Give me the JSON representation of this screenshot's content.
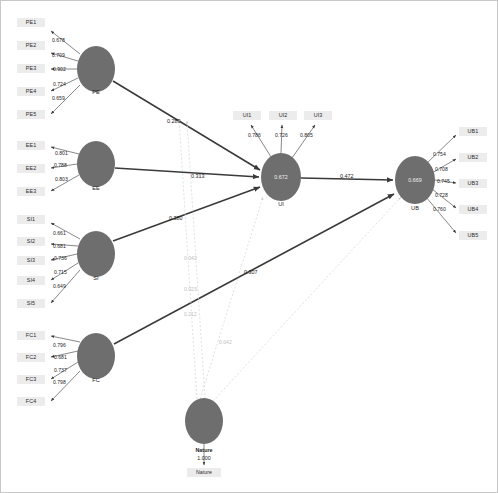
{
  "diagram": {
    "type": "sem-path-diagram",
    "node_fill": "#6e6e6e",
    "indicator_fill": "#ececec",
    "edge_color": "#3a3a3a",
    "moderation_edge_color": "#cfcfcf"
  },
  "constructs": [
    {
      "id": "PE",
      "label": "PE",
      "cx": 95,
      "cy": 68,
      "rx": 19,
      "ry": 23,
      "value": "",
      "indicators": [
        {
          "label": "PE1",
          "loading": "0.678",
          "x": 16,
          "y": 17,
          "w": 28
        },
        {
          "label": "PE2",
          "loading": "0.709",
          "x": 16,
          "y": 40,
          "w": 28
        },
        {
          "label": "PE3",
          "loading": "0.902",
          "x": 16,
          "y": 63,
          "w": 28
        },
        {
          "label": "PE4",
          "loading": "0.724",
          "x": 16,
          "y": 86,
          "w": 28
        },
        {
          "label": "PE5",
          "loading": "0.659",
          "x": 16,
          "y": 109,
          "w": 28
        }
      ]
    },
    {
      "id": "EE",
      "label": "EE",
      "cx": 95,
      "cy": 163,
      "rx": 19,
      "ry": 23,
      "value": "",
      "indicators": [
        {
          "label": "EE1",
          "loading": "0.801",
          "x": 16,
          "y": 140,
          "w": 28
        },
        {
          "label": "EE2",
          "loading": "0.788",
          "x": 16,
          "y": 163,
          "w": 28
        },
        {
          "label": "EE3",
          "loading": "0.803",
          "x": 16,
          "y": 186,
          "w": 28
        }
      ]
    },
    {
      "id": "SI",
      "label": "SI",
      "cx": 95,
      "cy": 253,
      "rx": 19,
      "ry": 23,
      "value": "",
      "indicators": [
        {
          "label": "SI1",
          "loading": "0.661",
          "x": 16,
          "y": 214,
          "w": 28
        },
        {
          "label": "SI2",
          "loading": "0.681",
          "x": 16,
          "y": 236,
          "w": 28
        },
        {
          "label": "SI3",
          "loading": "0.736",
          "x": 16,
          "y": 255,
          "w": 28
        },
        {
          "label": "SI4",
          "loading": "0.715",
          "x": 16,
          "y": 275,
          "w": 28
        },
        {
          "label": "SI5",
          "loading": "0.649",
          "x": 16,
          "y": 298,
          "w": 28
        }
      ]
    },
    {
      "id": "FC",
      "label": "FC",
      "cx": 95,
      "cy": 355,
      "rx": 19,
      "ry": 23,
      "value": "",
      "indicators": [
        {
          "label": "FC1",
          "loading": "0.796",
          "x": 16,
          "y": 330,
          "w": 28
        },
        {
          "label": "FC2",
          "loading": "0.681",
          "x": 16,
          "y": 352,
          "w": 28
        },
        {
          "label": "FC3",
          "loading": "0.737",
          "x": 16,
          "y": 374,
          "w": 28
        },
        {
          "label": "FC4",
          "loading": "0.798",
          "x": 16,
          "y": 396,
          "w": 28
        }
      ]
    },
    {
      "id": "UI",
      "label": "UI",
      "cx": 280,
      "cy": 176,
      "rx": 20,
      "ry": 24,
      "value": "0.672",
      "indicators": [
        {
          "label": "UI1",
          "loading": "0.786",
          "x": 232,
          "y": 110,
          "w": 28
        },
        {
          "label": "UI2",
          "loading": "0.726",
          "x": 268,
          "y": 110,
          "w": 28
        },
        {
          "label": "UI3",
          "loading": "0.805",
          "x": 303,
          "y": 110,
          "w": 28
        }
      ]
    },
    {
      "id": "UB",
      "label": "UB",
      "cx": 414,
      "cy": 179,
      "rx": 20,
      "ry": 24,
      "value": "0.669",
      "indicators": [
        {
          "label": "UB1",
          "loading": "0.754",
          "x": 458,
          "y": 126,
          "w": 28
        },
        {
          "label": "UB2",
          "loading": "0.708",
          "x": 458,
          "y": 152,
          "w": 28
        },
        {
          "label": "UB3",
          "loading": "0.745",
          "x": 458,
          "y": 178,
          "w": 28
        },
        {
          "label": "UB4",
          "loading": "0.728",
          "x": 458,
          "y": 204,
          "w": 28
        },
        {
          "label": "UB5",
          "loading": "0.760",
          "x": 458,
          "y": 230,
          "w": 28
        }
      ]
    },
    {
      "id": "Nature",
      "label": "Nature",
      "cx": 203,
      "cy": 420,
      "rx": 19,
      "ry": 23,
      "value": "",
      "indicators": [
        {
          "label": "Nature",
          "loading": "1.000",
          "x": 186,
          "y": 467,
          "w": 34
        }
      ]
    }
  ],
  "structural_paths": [
    {
      "from": "PE",
      "to": "UI",
      "coefficient": "0.289",
      "lx": 166,
      "ly": 117
    },
    {
      "from": "EE",
      "to": "UI",
      "coefficient": "0.313",
      "lx": 190,
      "ly": 172
    },
    {
      "from": "SI",
      "to": "UI",
      "coefficient": "0.380",
      "lx": 168,
      "ly": 214
    },
    {
      "from": "UI",
      "to": "UB",
      "coefficient": "0.472",
      "lx": 339,
      "ly": 172
    },
    {
      "from": "FC",
      "to": "UB",
      "coefficient": "0.307",
      "lx": 243,
      "ly": 268
    }
  ],
  "moderation_paths": [
    {
      "from": "Nature",
      "to": "UI",
      "coefficient": "0.042",
      "lx": 183,
      "ly": 254
    },
    {
      "from": "Nature",
      "to": "UI",
      "coefficient": "0.023",
      "lx": 183,
      "ly": 285
    },
    {
      "from": "Nature",
      "to": "UI",
      "coefficient": "0.212",
      "lx": 183,
      "ly": 310
    },
    {
      "from": "Nature",
      "to": "UB",
      "coefficient": "0.042",
      "lx": 218,
      "ly": 338
    }
  ],
  "moderator": {
    "name": "Nature",
    "loading": "1.000",
    "label_x": 203,
    "label_y": 446,
    "value_y": 454
  }
}
